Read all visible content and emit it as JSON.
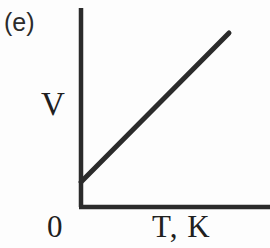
{
  "figure": {
    "panel_label": "(e)",
    "origin_label": "0",
    "background_color": "#fdfdfd",
    "ink_color": "#2b2b2b"
  },
  "chart_data": {
    "type": "line",
    "title": "",
    "subtitle": "",
    "panel": "(e)",
    "xlabel": "T, K",
    "ylabel": "V",
    "annotations": [
      "0"
    ],
    "grid": false,
    "legend": null,
    "axis_style": "two-sided-open",
    "xlim": [
      0,
      1
    ],
    "ylim": [
      0,
      1
    ],
    "x_ticks": [],
    "y_ticks": [],
    "series": [
      {
        "name": "V vs T",
        "relationship": "linear increasing with positive intercept",
        "x": [
          0.0,
          1.0
        ],
        "values": [
          0.13,
          0.88
        ],
        "line_color": "#2b2b2b",
        "line_width": 5
      }
    ],
    "pixel_geometry": {
      "y_axis_x": 80,
      "y_axis_top_y": 8,
      "x_axis_y": 207,
      "x_axis_right_x": 270,
      "line_start": [
        80,
        182
      ],
      "line_end": [
        228,
        33
      ]
    }
  }
}
